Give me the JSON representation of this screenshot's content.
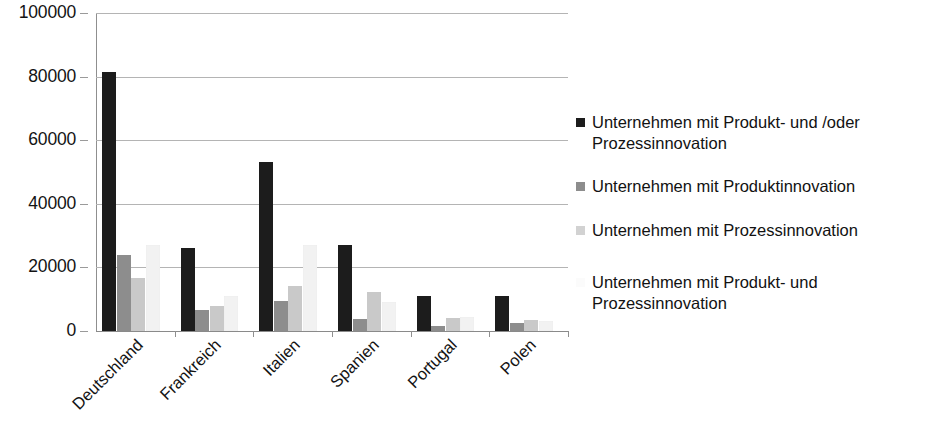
{
  "chart_data": {
    "type": "bar",
    "title": "",
    "subtitle": "",
    "xlabel": "",
    "ylabel": "",
    "ylim": [
      0,
      100000
    ],
    "ytick_labels": [
      "0",
      "20000",
      "40000",
      "60000",
      "80000",
      "100000"
    ],
    "ytick_values": [
      0,
      20000,
      40000,
      60000,
      80000,
      100000
    ],
    "grid": true,
    "legend_position": "right",
    "orientation": "vertical",
    "grouped": true,
    "categories": [
      "Deutschland",
      "Frankreich",
      "Italien",
      "Spanien",
      "Portugal",
      "Polen"
    ],
    "series": [
      {
        "name": "Unternehmen mit Produkt- und /oder Prozessinnovation",
        "color": "#1c1c1c",
        "values": [
          81400,
          26000,
          53000,
          27200,
          11000,
          10900
        ]
      },
      {
        "name": "Unternehmen mit Produktinnovation",
        "color": "#8d8d8d",
        "values": [
          23900,
          6600,
          9400,
          3700,
          1500,
          2500
        ]
      },
      {
        "name": "Unternehmen mit Prozessinnovation",
        "color": "#c9c9c9",
        "values": [
          16800,
          8000,
          14000,
          12400,
          4000,
          3400
        ]
      },
      {
        "name": "Unternehmen mit Produkt- und Prozessinnovation",
        "color": "#f2f2f2",
        "values": [
          26900,
          11000,
          26900,
          9100,
          4500,
          3000
        ]
      }
    ]
  },
  "legend": {
    "entries": [
      {
        "label": "Unternehmen mit Produkt- und /oder Prozessinnovation",
        "swatch_color": "#1c1c1c"
      },
      {
        "label": "Unternehmen mit Produktinnovation",
        "swatch_color": "#8d8d8d"
      },
      {
        "label": "Unternehmen mit Prozessinnovation",
        "swatch_color": "#d2d2d2"
      },
      {
        "label": "Unternehmen mit Produkt- und Prozessinnovation",
        "swatch_color": "#fbfbfb"
      }
    ]
  }
}
